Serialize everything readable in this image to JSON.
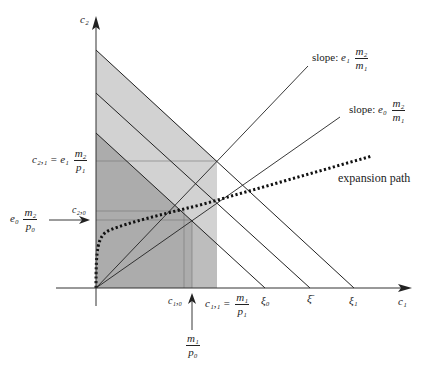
{
  "diagram": {
    "axes": {
      "x_label": "c₁",
      "y_label": "c₂"
    },
    "budget_lines": [
      {
        "name": "xi0",
        "label": "ξ₀"
      },
      {
        "name": "xibar",
        "label": "ξ̄"
      },
      {
        "name": "xi1",
        "label": "ξ₁"
      }
    ],
    "rays": [
      {
        "name": "slope-e1",
        "label_prefix": "slope:",
        "coef": "e₁",
        "num": "m₂",
        "den": "m₁"
      },
      {
        "name": "slope-e0",
        "label_prefix": "slope:",
        "coef": "e₀",
        "num": "m₂",
        "den": "m₁"
      }
    ],
    "expansion_path_label": "expansion path",
    "y_annotations": {
      "c21_lhs": "c₂,₁ = e₁",
      "c21_num": "m₂",
      "c21_den": "p₁",
      "c20": "c₂,₀",
      "e0_coef": "e₀",
      "e0_num": "m₂",
      "e0_den": "p₀"
    },
    "x_annotations": {
      "c10": "c₁,₀",
      "c11_lhs": "c₁,₁ =",
      "c11_num": "m₁",
      "c11_den": "p₁",
      "m1p0_num": "m₁",
      "m1p0_den": "p₀"
    },
    "colors": {
      "light_shade": "#cfcfcf",
      "mid_shade": "#b8b8b8",
      "dark_shade": "#a9a9a9",
      "line": "#222222",
      "guide": "#777777"
    }
  }
}
